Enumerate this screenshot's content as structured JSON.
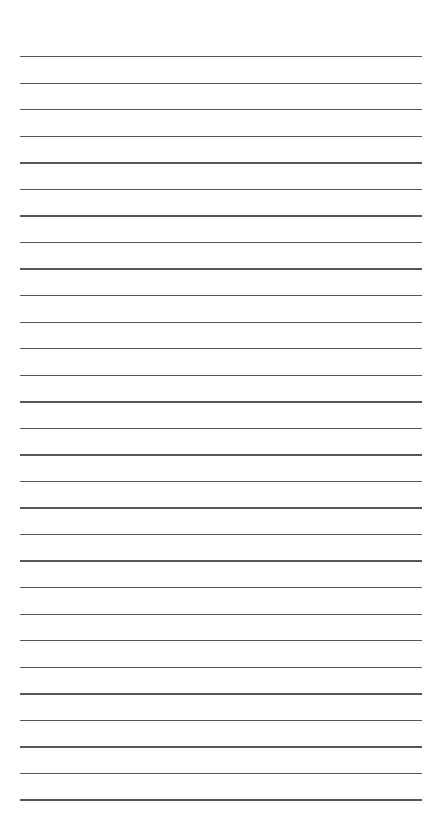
{
  "document": {
    "type": "lined-paper",
    "line_count": 29,
    "first_line_y": 56,
    "line_spacing": 26.55,
    "line_left": 20,
    "line_width": 402,
    "line_color": "#3a3a3a",
    "background_color": "#ffffff"
  }
}
